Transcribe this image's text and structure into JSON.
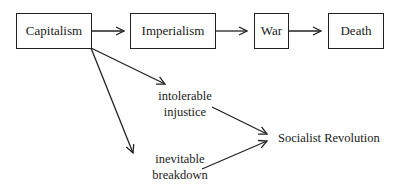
{
  "diagram": {
    "chain": [
      {
        "id": "capitalism",
        "label": "Capitalism"
      },
      {
        "id": "imperialism",
        "label": "Imperialism"
      },
      {
        "id": "war",
        "label": "War"
      },
      {
        "id": "death",
        "label": "Death"
      }
    ],
    "branches": [
      {
        "id": "injustice",
        "line1": "intolerable",
        "line2": "injustice"
      },
      {
        "id": "breakdown",
        "line1": "inevitable",
        "line2": "breakdown"
      }
    ],
    "outcome": {
      "id": "socialist-revolution",
      "label": "Socialist Revolution"
    },
    "edges": [
      {
        "from": "Capitalism",
        "to": "Imperialism"
      },
      {
        "from": "Imperialism",
        "to": "War"
      },
      {
        "from": "War",
        "to": "Death"
      },
      {
        "from": "Capitalism",
        "to": "intolerable injustice"
      },
      {
        "from": "Capitalism",
        "to": "inevitable breakdown"
      },
      {
        "from": "intolerable injustice",
        "to": "Socialist Revolution"
      },
      {
        "from": "inevitable breakdown",
        "to": "Socialist Revolution"
      }
    ]
  }
}
